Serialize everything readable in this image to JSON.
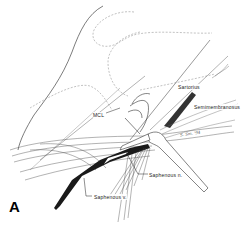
{
  "figure": {
    "panel_label": "A",
    "labels": {
      "sartorius": "Sartorius",
      "semimembranosus": "Semimembranosus",
      "mcl": "MCL",
      "saphenous_nerve": "Saphenous n.",
      "saphenous_vein": "Saphenous v."
    },
    "signature": "S. Sm. '94",
    "colors": {
      "background": "#ffffff",
      "ink": "#222222",
      "dashed_outline": "#999999",
      "vein_fill": "#1a1a1a"
    }
  }
}
